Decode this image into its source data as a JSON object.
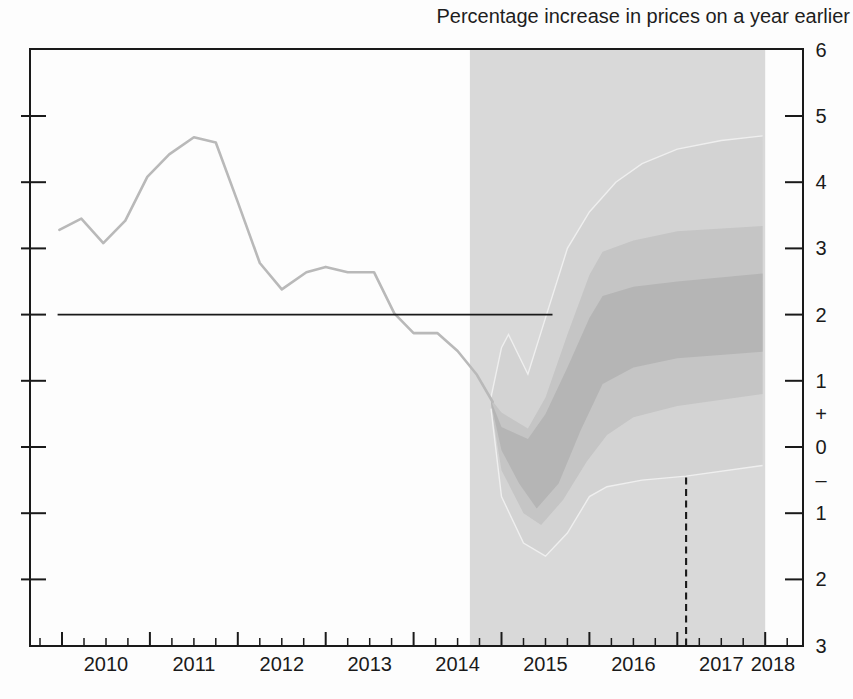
{
  "chart_data": {
    "type": "line",
    "subtype": "fan-chart",
    "title": "Percentage increase in prices on a year earlier",
    "x_axis": {
      "range": [
        2009.64,
        2018.43
      ],
      "major_ticks": [
        2010,
        2011,
        2012,
        2013,
        2014,
        2015,
        2016,
        2017,
        2018
      ],
      "minor_tick_interval": 0.25,
      "labels": [
        "2010",
        "2011",
        "2012",
        "2013",
        "2014",
        "2015",
        "2016",
        "2017",
        "2018"
      ]
    },
    "y_axis": {
      "range": [
        -3,
        6
      ],
      "tick_values": [
        5,
        4,
        3,
        2,
        1,
        0,
        -1,
        -2
      ],
      "right_labels": [
        {
          "value": 6,
          "text": "6"
        },
        {
          "value": 5,
          "text": "5"
        },
        {
          "value": 4,
          "text": "4"
        },
        {
          "value": 3,
          "text": "3"
        },
        {
          "value": 2,
          "text": "2"
        },
        {
          "value": 1,
          "text": "1"
        },
        {
          "value": 0.5,
          "text": "+"
        },
        {
          "value": 0,
          "text": "0"
        },
        {
          "value": -0.5,
          "text": "–"
        },
        {
          "value": -1,
          "text": "1"
        },
        {
          "value": -2,
          "text": "2"
        },
        {
          "value": -3,
          "text": "3"
        }
      ]
    },
    "forecast_region": {
      "start": 2014.64,
      "end": 2018.0
    },
    "target_line": {
      "value": 2.0,
      "start": 2009.95,
      "end": 2015.58
    },
    "dashed_marker": {
      "x": 2017.1,
      "top": -0.46,
      "bottom": -3
    },
    "history": {
      "points": [
        [
          2009.97,
          3.28
        ],
        [
          2010.22,
          3.45
        ],
        [
          2010.47,
          3.08
        ],
        [
          2010.72,
          3.42
        ],
        [
          2010.97,
          4.08
        ],
        [
          2011.22,
          4.42
        ],
        [
          2011.5,
          4.68
        ],
        [
          2011.75,
          4.6
        ],
        [
          2012.0,
          3.7
        ],
        [
          2012.25,
          2.78
        ],
        [
          2012.5,
          2.38
        ],
        [
          2012.78,
          2.64
        ],
        [
          2013.0,
          2.72
        ],
        [
          2013.25,
          2.64
        ],
        [
          2013.55,
          2.64
        ],
        [
          2013.78,
          2.02
        ],
        [
          2014.0,
          1.72
        ],
        [
          2014.27,
          1.72
        ],
        [
          2014.5,
          1.45
        ],
        [
          2014.72,
          1.09
        ],
        [
          2014.9,
          0.68
        ]
      ]
    },
    "bands": {
      "outer": {
        "top": [
          [
            2014.88,
            0.75
          ],
          [
            2015.0,
            1.5
          ],
          [
            2015.08,
            1.7
          ],
          [
            2015.3,
            1.1
          ],
          [
            2015.5,
            1.95
          ],
          [
            2015.75,
            3.0
          ],
          [
            2016.0,
            3.55
          ],
          [
            2016.3,
            4.0
          ],
          [
            2016.6,
            4.28
          ],
          [
            2017.0,
            4.5
          ],
          [
            2017.5,
            4.63
          ],
          [
            2017.97,
            4.7
          ]
        ],
        "bottom": [
          [
            2014.88,
            0.58
          ],
          [
            2015.0,
            -0.75
          ],
          [
            2015.25,
            -1.45
          ],
          [
            2015.5,
            -1.65
          ],
          [
            2015.75,
            -1.3
          ],
          [
            2016.0,
            -0.75
          ],
          [
            2016.2,
            -0.6
          ],
          [
            2016.6,
            -0.5
          ],
          [
            2017.1,
            -0.44
          ],
          [
            2017.97,
            -0.28
          ]
        ]
      },
      "middle": {
        "top": [
          [
            2014.88,
            0.72
          ],
          [
            2015.0,
            0.52
          ],
          [
            2015.3,
            0.28
          ],
          [
            2015.5,
            0.75
          ],
          [
            2015.75,
            1.7
          ],
          [
            2016.0,
            2.6
          ],
          [
            2016.15,
            2.95
          ],
          [
            2016.5,
            3.12
          ],
          [
            2017.0,
            3.26
          ],
          [
            2017.97,
            3.34
          ]
        ],
        "bottom": [
          [
            2014.88,
            0.62
          ],
          [
            2015.0,
            -0.35
          ],
          [
            2015.25,
            -1.0
          ],
          [
            2015.45,
            -1.18
          ],
          [
            2015.7,
            -0.8
          ],
          [
            2015.97,
            -0.22
          ],
          [
            2016.2,
            0.18
          ],
          [
            2016.5,
            0.45
          ],
          [
            2017.0,
            0.62
          ],
          [
            2017.97,
            0.8
          ]
        ]
      },
      "inner": {
        "top": [
          [
            2014.88,
            0.7
          ],
          [
            2015.0,
            0.3
          ],
          [
            2015.3,
            0.12
          ],
          [
            2015.5,
            0.5
          ],
          [
            2015.75,
            1.2
          ],
          [
            2016.0,
            1.95
          ],
          [
            2016.15,
            2.28
          ],
          [
            2016.5,
            2.42
          ],
          [
            2017.0,
            2.5
          ],
          [
            2017.97,
            2.62
          ]
        ],
        "bottom": [
          [
            2014.88,
            0.66
          ],
          [
            2015.0,
            -0.05
          ],
          [
            2015.2,
            -0.55
          ],
          [
            2015.4,
            -0.93
          ],
          [
            2015.65,
            -0.55
          ],
          [
            2015.9,
            0.25
          ],
          [
            2016.15,
            0.95
          ],
          [
            2016.5,
            1.2
          ],
          [
            2017.0,
            1.34
          ],
          [
            2017.97,
            1.44
          ]
        ]
      }
    },
    "colors": {
      "forecast_background": "#d9d9d9",
      "band_outer": "#d3d3d3",
      "band_middle": "#c5c5c5",
      "band_inner": "#b5b5b5",
      "band_edge_line": "#efefef",
      "history_line": "#b9b9b9",
      "axis": "#1a1a1a",
      "target_line": "#1a1a1a",
      "dashed_marker": "#1a1a1a"
    }
  }
}
